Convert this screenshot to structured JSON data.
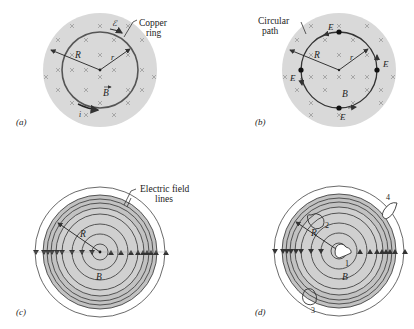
{
  "panels": {
    "a": {
      "label": "(a)",
      "callout": [
        "Copper",
        "ring"
      ],
      "symbols": {
        "R": "R",
        "r": "r",
        "B": "B",
        "emf": "ℰ",
        "current": "i"
      }
    },
    "b": {
      "label": "(b)",
      "callout": [
        "Circular",
        "path"
      ],
      "symbols": {
        "R": "R",
        "r": "r",
        "B": "B",
        "E": "E"
      }
    },
    "c": {
      "label": "(c)",
      "callout": [
        "Electric field",
        "lines"
      ],
      "symbols": {
        "R": "R",
        "B": "B"
      }
    },
    "d": {
      "label": "(d)",
      "symbols": {
        "R": "R",
        "B": "B"
      },
      "paths": [
        "1",
        "2",
        "3",
        "4"
      ]
    }
  },
  "colors": {
    "field_region": "#d9d9d9",
    "field_lines_region": "#b8b8b8",
    "lines": "#333333",
    "crosses": "#a0a0a0"
  }
}
